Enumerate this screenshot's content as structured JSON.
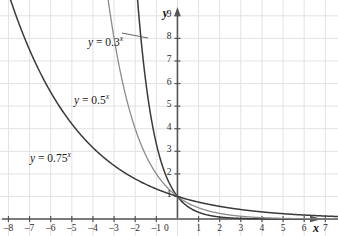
{
  "chart_data": {
    "type": "line",
    "title": "",
    "xlabel": "x",
    "ylabel": "y",
    "xlim": [
      -8.4,
      7.6
    ],
    "ylim": [
      -0.75,
      9.7
    ],
    "grid": true,
    "grid_step": 1,
    "legend": "inline-labels",
    "xticks": [
      -8,
      -7,
      -6,
      -5,
      -4,
      -3,
      -2,
      -1,
      0,
      1,
      2,
      3,
      4,
      5,
      6,
      7
    ],
    "xtick_labels": [
      "–8",
      "–7",
      "–6",
      "–5",
      "–4",
      "–3",
      "–2",
      "–1",
      "0",
      "1",
      "2",
      "3",
      "4",
      "5",
      "6",
      "7"
    ],
    "yticks": [
      1,
      2,
      3,
      4,
      5,
      6,
      7,
      8,
      9
    ],
    "ytick_labels": [
      "1",
      "2",
      "3",
      "4",
      "5",
      "6",
      "7",
      "8",
      "9"
    ],
    "series": [
      {
        "name": "y = 0.3^x",
        "label_html": "<i>y</i> = 0.3<sup>x</sup>",
        "base": 0.3,
        "color": "#3a3a3a",
        "width": 1.5,
        "label_x": 88,
        "label_y": 34,
        "leader": {
          "x1": 122,
          "y1": 33,
          "x2": 148,
          "y2": 38
        }
      },
      {
        "name": "y = 0.5^x",
        "label_html": "<i>y</i> = 0.5<sup>x</sup>",
        "base": 0.5,
        "color": "#8c8c8c",
        "width": 1.3,
        "label_x": 74,
        "label_y": 92,
        "leader": null
      },
      {
        "name": "y = 0.75^x",
        "label_html": "<i>y</i> = 0.75<sup>x</sup>",
        "base": 0.75,
        "color": "#3a3a3a",
        "width": 1.5,
        "label_x": 30,
        "label_y": 150,
        "leader": null
      }
    ],
    "axis_color": "#555555",
    "grid_color": "#e2e2e6",
    "axis_labels": {
      "x": "x",
      "y": "y"
    }
  },
  "axes": {
    "x_axis_name": "x",
    "y_axis_name": "y",
    "origin_label": "0"
  }
}
